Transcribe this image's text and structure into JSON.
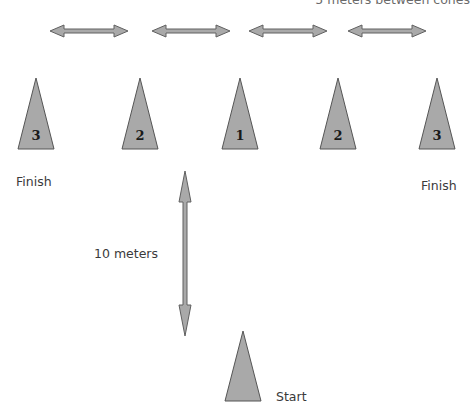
{
  "diagram": {
    "top_caption": "5 meters between cones",
    "distance_label": "10 meters",
    "cones": [
      {
        "number": "3",
        "role": "finish"
      },
      {
        "number": "2",
        "role": ""
      },
      {
        "number": "1",
        "role": ""
      },
      {
        "number": "2",
        "role": ""
      },
      {
        "number": "3",
        "role": "finish"
      }
    ],
    "start_cone": {
      "number": "",
      "label": "Start"
    },
    "finish_labels": [
      "Finish",
      "Finish"
    ],
    "colors": {
      "cone_fill": "#a9a9a9",
      "outline": "#555555",
      "text": "#3a3a3a"
    }
  }
}
